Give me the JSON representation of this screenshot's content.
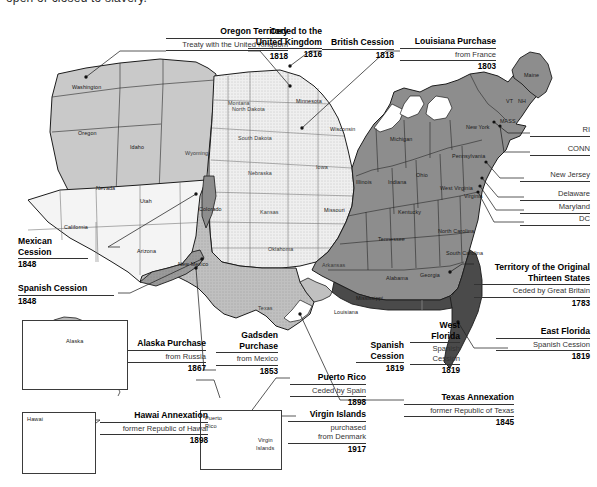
{
  "page": {
    "top_clipped_text": "open or closed to slavery."
  },
  "colors": {
    "original_thirteen": "#8d8d8d",
    "louisiana_purchase": "#efefef",
    "mexican_cession": "#f4f4f4",
    "texas_annexation": "#c0c0c0",
    "oregon_territory": "#c9c9c9",
    "florida_cession": "#4a4a4a",
    "gadsden_purchase": "#9a9a9a",
    "alaska": "#b9b9b9",
    "hawaii": "#c2c2c2",
    "outline": "#1c1c1c",
    "rule": "#333333"
  },
  "callouts": [
    {
      "id": "oregon-territory",
      "title": "Oregon Territory",
      "subtitle": "Treaty with the United Kingdom",
      "year": "1818",
      "align": "right"
    },
    {
      "id": "ceded-to-uk",
      "title_line1": "Ceded to the",
      "title_line2": "United Kingdom",
      "title": "Ceded to the United Kingdom",
      "year": "1816",
      "align": "right"
    },
    {
      "id": "british-cession",
      "title": "British Cession",
      "year": "1818",
      "align": "right"
    },
    {
      "id": "louisiana-purchase",
      "title": "Louisiana Purchase",
      "subtitle": "from France",
      "year": "1803",
      "align": "right"
    },
    {
      "id": "territory-original-thirteen",
      "title_line1": "Territory of the Original",
      "title_line2": "Thirteen States",
      "title": "Territory of the Original Thirteen States",
      "subtitle": "Ceded by Great Britain",
      "year": "1783",
      "align": "right"
    },
    {
      "id": "east-florida",
      "title": "East Florida",
      "subtitle": "Spanish Cession",
      "year": "1819",
      "align": "right"
    },
    {
      "id": "west-florida",
      "title_line1": "West",
      "title_line2": "Florida",
      "title": "West Florida",
      "subtitle_line1": "Spanish",
      "subtitle_line2": "Cession",
      "subtitle": "Spanish Cession",
      "year": "1819",
      "align": "center"
    },
    {
      "id": "spanish-cession-gulf",
      "title_line1": "Spanish",
      "title_line2": "Cession",
      "title": "Spanish Cession",
      "year": "1819",
      "align": "center"
    },
    {
      "id": "texas-annexation",
      "title": "Texas Annexation",
      "subtitle": "former Republic of Texas",
      "year": "1845",
      "align": "right"
    },
    {
      "id": "mexican-cession",
      "title_line1": "Mexican",
      "title_line2": "Cession",
      "title": "Mexican Cession",
      "year": "1848",
      "align": "left"
    },
    {
      "id": "spanish-cession-west",
      "title": "Spanish Cession",
      "year": "1848",
      "align": "left"
    },
    {
      "id": "alaska-purchase",
      "title": "Alaska Purchase",
      "subtitle": "from Russia",
      "year": "1867",
      "align": "right"
    },
    {
      "id": "gadsden-purchase",
      "title_line1": "Gadsden",
      "title_line2": "Purchase",
      "title": "Gadsden Purchase",
      "subtitle": "from Mexico",
      "year": "1853",
      "align": "right"
    },
    {
      "id": "hawaii-annexation",
      "title": "Hawai Annexation",
      "subtitle": "former Republic of Hawai",
      "year": "1898",
      "align": "right"
    },
    {
      "id": "puerto-rico",
      "title": "Puerto Rico",
      "subtitle": "Ceded by Spain",
      "year": "1898",
      "align": "right"
    },
    {
      "id": "virgin-islands",
      "title": "Virgin Islands",
      "subtitle_line1": "purchased",
      "subtitle_line2": "from Denmark",
      "subtitle": "purchased from Denmark",
      "year": "1917",
      "align": "right"
    }
  ],
  "edge_labels": [
    {
      "id": "ri",
      "label": "RI"
    },
    {
      "id": "conn",
      "label": "CONN"
    },
    {
      "id": "new-jersey",
      "label": "New Jersey"
    },
    {
      "id": "delaware",
      "label": "Delaware"
    },
    {
      "id": "maryland",
      "label": "Maryland"
    },
    {
      "id": "dc",
      "label": "DC"
    }
  ],
  "states": [
    {
      "id": "washington",
      "label": "Washington"
    },
    {
      "id": "oregon",
      "label": "Oregon"
    },
    {
      "id": "idaho",
      "label": "Idaho"
    },
    {
      "id": "montana",
      "label": "Montana"
    },
    {
      "id": "wyoming",
      "label": "Wyoming"
    },
    {
      "id": "nevada",
      "label": "Nevada"
    },
    {
      "id": "utah",
      "label": "Utah"
    },
    {
      "id": "california",
      "label": "California"
    },
    {
      "id": "arizona",
      "label": "Arizona"
    },
    {
      "id": "new-mexico",
      "label": "New Mexico"
    },
    {
      "id": "colorado",
      "label": "Colorado"
    },
    {
      "id": "north-dakota",
      "label": "North Dakota"
    },
    {
      "id": "south-dakota",
      "label": "South Dakota"
    },
    {
      "id": "nebraska",
      "label": "Nebraska"
    },
    {
      "id": "kansas",
      "label": "Kansas"
    },
    {
      "id": "oklahoma",
      "label": "Oklahoma"
    },
    {
      "id": "texas",
      "label": "Texas"
    },
    {
      "id": "minnesota",
      "label": "Minnesota"
    },
    {
      "id": "iowa",
      "label": "Iowa"
    },
    {
      "id": "missouri",
      "label": "Missouri"
    },
    {
      "id": "arkansas",
      "label": "Arkansas"
    },
    {
      "id": "louisiana",
      "label": "Louisiana"
    },
    {
      "id": "wisconsin",
      "label": "Wisconsin"
    },
    {
      "id": "michigan",
      "label": "Michigan"
    },
    {
      "id": "illinois",
      "label": "Illinois"
    },
    {
      "id": "indiana",
      "label": "Indiana"
    },
    {
      "id": "ohio",
      "label": "Ohio"
    },
    {
      "id": "kentucky",
      "label": "Kentucky"
    },
    {
      "id": "tennessee",
      "label": "Tennessee"
    },
    {
      "id": "mississippi",
      "label": "Mississippi"
    },
    {
      "id": "alabama",
      "label": "Alabama"
    },
    {
      "id": "georgia",
      "label": "Georgia"
    },
    {
      "id": "north-carolina",
      "label": "North Carolina"
    },
    {
      "id": "south-carolina",
      "label": "South Carolina"
    },
    {
      "id": "virginia",
      "label": "Virginia"
    },
    {
      "id": "west-virginia",
      "label": "West Virginia"
    },
    {
      "id": "pennsylvania",
      "label": "Pennsylvania"
    },
    {
      "id": "new-york",
      "label": "New York"
    },
    {
      "id": "maine",
      "label": "Maine"
    },
    {
      "id": "vt",
      "label": "VT"
    },
    {
      "id": "nh",
      "label": "NH"
    },
    {
      "id": "mass",
      "label": "MASS"
    }
  ],
  "insets": [
    {
      "id": "alaska",
      "label": "Alaska"
    },
    {
      "id": "hawaii",
      "label": "Hawai"
    },
    {
      "id": "puerto-rico",
      "label_line1": "Puerto",
      "label_line2": "Rico",
      "label": "Puerto Rico"
    },
    {
      "id": "virgin-islands",
      "label_line1": "Virgin",
      "label_line2": "Islands",
      "label": "Virgin Islands"
    }
  ]
}
